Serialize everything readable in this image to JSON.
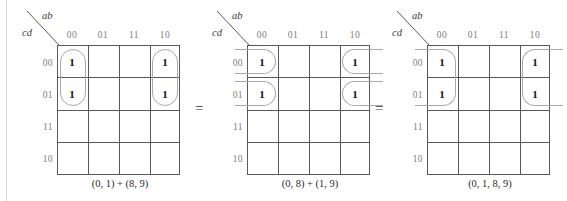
{
  "figure": {
    "axis_top_label": "ab",
    "axis_side_label": "cd",
    "column_headers": [
      "00",
      "01",
      "11",
      "10"
    ],
    "row_headers": [
      "00",
      "01",
      "11",
      "10"
    ],
    "one_value": "1",
    "equals_sign": "="
  },
  "maps": [
    {
      "caption": "(0, 1) + (8, 9)",
      "ones": [
        {
          "row": 0,
          "col": 0,
          "value": "1"
        },
        {
          "row": 1,
          "col": 0,
          "value": "1"
        },
        {
          "row": 0,
          "col": 3,
          "value": "1"
        },
        {
          "row": 1,
          "col": 3,
          "value": "1"
        }
      ],
      "groups": [
        {
          "kind": "pill-v",
          "col": 0,
          "row_start": 0,
          "row_span": 2
        },
        {
          "kind": "pill-v",
          "col": 3,
          "row_start": 0,
          "row_span": 2
        }
      ]
    },
    {
      "caption": "(0, 8) + (1, 9)",
      "ones": [
        {
          "row": 0,
          "col": 0,
          "value": "1"
        },
        {
          "row": 1,
          "col": 0,
          "value": "1"
        },
        {
          "row": 0,
          "col": 3,
          "value": "1"
        },
        {
          "row": 1,
          "col": 3,
          "value": "1"
        }
      ],
      "groups": [
        {
          "kind": "wrap-left",
          "col": 0,
          "row": 0
        },
        {
          "kind": "wrap-left",
          "col": 0,
          "row": 1
        },
        {
          "kind": "wrap-right",
          "col": 3,
          "row": 0
        },
        {
          "kind": "wrap-right",
          "col": 3,
          "row": 1
        }
      ]
    },
    {
      "caption": "(0, 1, 8, 9)",
      "ones": [
        {
          "row": 0,
          "col": 0,
          "value": "1"
        },
        {
          "row": 1,
          "col": 0,
          "value": "1"
        },
        {
          "row": 0,
          "col": 3,
          "value": "1"
        },
        {
          "row": 1,
          "col": 3,
          "value": "1"
        }
      ],
      "groups": [
        {
          "kind": "tallwrap-left",
          "col": 0,
          "row_start": 0,
          "row_span": 2
        },
        {
          "kind": "tallwrap-right",
          "col": 3,
          "row_start": 0,
          "row_span": 2
        }
      ]
    }
  ],
  "colors": {
    "grid_line": "#59595c",
    "group_outline": "#a9a9ad",
    "header_text": "#7d7d80",
    "body_text": "#2b2b2b",
    "background": "#ffffff"
  }
}
